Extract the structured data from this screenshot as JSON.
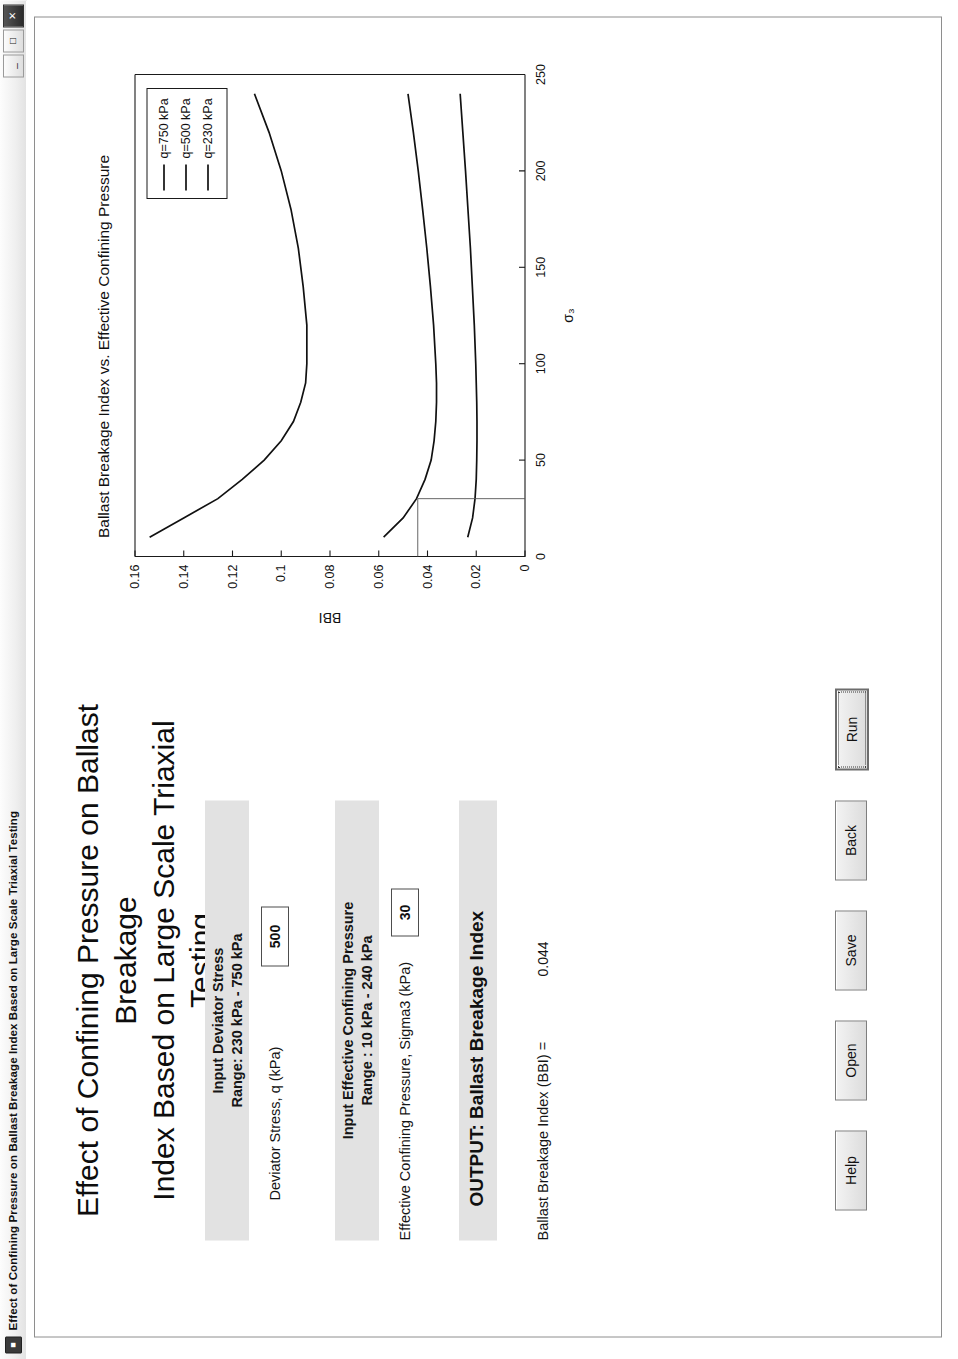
{
  "window": {
    "titlebar_icon": "matlab-figure-icon",
    "title": "Effect of Confining Pressure on Ballast Breakage Index Based on Large Scale Triaxial Testing",
    "minimize_label": "_",
    "maximize_label": "□",
    "close_label": "✕"
  },
  "heading": {
    "line1": "Effect of Confining Pressure on Ballast Breakage",
    "line2": "Index Based on Large Scale Triaxial Testing"
  },
  "panel_deviator": {
    "title_line1": "Input Deviator Stress",
    "title_line2": "Range: 230 kPa - 750 kPa",
    "field_label": "Deviator Stress, q (kPa)",
    "field_value": "500"
  },
  "panel_confining": {
    "title_line1": "Input Effective Confining Pressure",
    "title_line2": "Range : 10 kPa - 240 kPa",
    "field_label": "Effective Confining Pressure, Sigma3 (kPa)",
    "field_value": "30"
  },
  "output": {
    "title": "OUTPUT: Ballast Breakage Index",
    "label": "Ballast Breakage Index (BBI) =",
    "value": "0.044"
  },
  "buttons": [
    {
      "name": "help-button",
      "label": "Help",
      "focused": false
    },
    {
      "name": "open-button",
      "label": "Open",
      "focused": false
    },
    {
      "name": "save-button",
      "label": "Save",
      "focused": false
    },
    {
      "name": "back-button",
      "label": "Back",
      "focused": false
    },
    {
      "name": "run-button",
      "label": "Run",
      "focused": true
    }
  ],
  "chart_data": {
    "type": "line",
    "title": "Ballast Breakage Index vs. Effective Confining Pressure",
    "xlabel": "σ₃",
    "ylabel": "BBI",
    "xlim": [
      0,
      250
    ],
    "ylim": [
      0,
      0.16
    ],
    "xticks": [
      0,
      50,
      100,
      150,
      200,
      250
    ],
    "xticklabels": [
      "0",
      "50",
      "100",
      "150",
      "200",
      "250"
    ],
    "yticks": [
      0,
      0.02,
      0.04,
      0.06,
      0.08,
      0.1,
      0.12,
      0.14,
      0.16
    ],
    "yticklabels": [
      "0",
      "0.02",
      "0.04",
      "0.06",
      "0.08",
      "0.1",
      "0.12",
      "0.14",
      "0.16"
    ],
    "grid": false,
    "legend_position": "top-right",
    "series": [
      {
        "name": "q=750 kPa",
        "x": [
          10,
          20,
          30,
          40,
          50,
          60,
          70,
          80,
          90,
          100,
          120,
          140,
          160,
          180,
          200,
          220,
          240
        ],
        "y": [
          0.154,
          0.14,
          0.126,
          0.116,
          0.107,
          0.1,
          0.095,
          0.092,
          0.09,
          0.0895,
          0.0895,
          0.091,
          0.093,
          0.096,
          0.1,
          0.105,
          0.111
        ]
      },
      {
        "name": "q=500 kPa",
        "x": [
          10,
          20,
          30,
          40,
          50,
          60,
          70,
          80,
          90,
          100,
          120,
          140,
          160,
          180,
          200,
          220,
          240
        ],
        "y": [
          0.058,
          0.05,
          0.0445,
          0.041,
          0.0385,
          0.0373,
          0.0366,
          0.0363,
          0.0363,
          0.0366,
          0.0375,
          0.0388,
          0.0403,
          0.042,
          0.0438,
          0.0458,
          0.048
        ]
      },
      {
        "name": "q=230 kPa",
        "x": [
          10,
          20,
          30,
          40,
          50,
          60,
          70,
          80,
          90,
          100,
          120,
          140,
          160,
          180,
          200,
          220,
          240
        ],
        "y": [
          0.0235,
          0.0215,
          0.0205,
          0.02,
          0.0198,
          0.0197,
          0.0197,
          0.0198,
          0.02,
          0.0202,
          0.0208,
          0.0216,
          0.0224,
          0.0234,
          0.0244,
          0.0255,
          0.0266
        ]
      }
    ],
    "cursor": {
      "x": 30,
      "y": 0.044,
      "visible": true
    }
  }
}
